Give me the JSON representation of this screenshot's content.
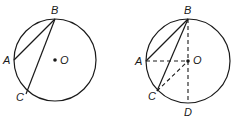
{
  "figures": [
    {
      "id": "left",
      "circle": {
        "cx": 55,
        "cy": 60,
        "r": 41
      },
      "points": {
        "A": {
          "x": 14,
          "y": 60,
          "label": "A",
          "lx": 3,
          "ly": 64
        },
        "B": {
          "x": 55,
          "y": 19,
          "label": "B",
          "lx": 51,
          "ly": 14
        },
        "C": {
          "x": 26,
          "y": 94,
          "label": "C",
          "lx": 16,
          "ly": 101
        },
        "O": {
          "x": 55,
          "y": 60,
          "label": "O",
          "lx": 60,
          "ly": 64
        }
      },
      "solid_segments": [
        [
          "B",
          "A"
        ],
        [
          "B",
          "C"
        ]
      ],
      "dashed_segments": []
    },
    {
      "id": "right",
      "circle": {
        "cx": 188,
        "cy": 61,
        "r": 42
      },
      "points": {
        "A": {
          "x": 146,
          "y": 61,
          "label": "A",
          "lx": 135,
          "ly": 65
        },
        "B": {
          "x": 188,
          "y": 19,
          "label": "B",
          "lx": 184,
          "ly": 14
        },
        "C": {
          "x": 157,
          "y": 91,
          "label": "C",
          "lx": 148,
          "ly": 100
        },
        "O": {
          "x": 188,
          "y": 61,
          "label": "O",
          "lx": 193,
          "ly": 64
        },
        "D": {
          "x": 188,
          "y": 103,
          "label": "D",
          "lx": 184,
          "ly": 116
        }
      },
      "solid_segments": [
        [
          "B",
          "A"
        ],
        [
          "B",
          "C"
        ]
      ],
      "dashed_segments": [
        [
          "A",
          "O"
        ],
        [
          "B",
          "D"
        ],
        [
          "C",
          "O"
        ]
      ]
    }
  ],
  "labels": {
    "left_A": "A",
    "left_B": "B",
    "left_C": "C",
    "left_O": "O",
    "right_A": "A",
    "right_B": "B",
    "right_C": "C",
    "right_O": "O",
    "right_D": "D"
  },
  "colors": {
    "stroke": "#1a1a1a",
    "background": "#ffffff"
  }
}
